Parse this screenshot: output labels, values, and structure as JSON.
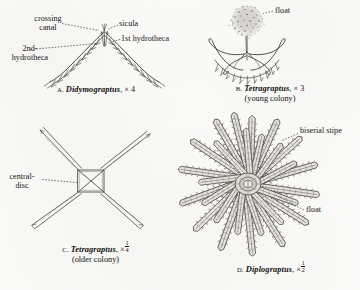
{
  "plate": {
    "medium": "engraved line drawings, grayscale ink on aged paper",
    "subject": "graptolite colonies"
  },
  "figures": [
    {
      "id": "a",
      "letter": "A.",
      "genus": "Didymograptus",
      "magnification": "× 4",
      "subtitle": "",
      "labels": [
        {
          "name": "crossing-canal",
          "text_line1": "crossing",
          "text_line2": "canal"
        },
        {
          "name": "sicula",
          "text_line1": "sicula",
          "text_line2": ""
        },
        {
          "name": "first-hydrotheca",
          "text_line1": "1st hydrotheca",
          "text_line2": ""
        },
        {
          "name": "second-hydrotheca",
          "text_line1": "2nd-",
          "text_line2": "hydrotheca"
        }
      ]
    },
    {
      "id": "b",
      "letter": "B.",
      "genus": "Tetragraptus",
      "magnification": "× 3",
      "subtitle": "(young colony)",
      "labels": [
        {
          "name": "float",
          "text_line1": "float",
          "text_line2": ""
        }
      ]
    },
    {
      "id": "c",
      "letter": "C.",
      "genus": "Tetragraptus",
      "magnification_prefix": "×",
      "magnification_numerator": "1",
      "magnification_denominator": "4",
      "subtitle": "(older colony)",
      "labels": [
        {
          "name": "central-disc",
          "text_line1": "central-",
          "text_line2": "disc"
        }
      ]
    },
    {
      "id": "d",
      "letter": "D.",
      "genus": "Diplograptus",
      "magnification_prefix": "×",
      "magnification_numerator": "1",
      "magnification_denominator": "2",
      "subtitle": "",
      "labels": [
        {
          "name": "biserial-stipe",
          "text_line1": "biserial stipe",
          "text_line2": ""
        },
        {
          "name": "float",
          "text_line1": "float",
          "text_line2": ""
        }
      ]
    }
  ],
  "colors": {
    "ink": "#1e1c1a",
    "paper": "#fbfbf9",
    "line": "#3c3834",
    "stipple": "#6b6560"
  }
}
